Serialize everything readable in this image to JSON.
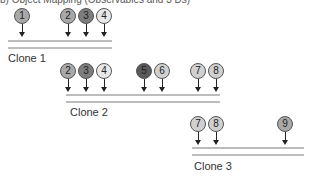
{
  "caption": "b) Object Mapping (Observables and 3 Ds)",
  "colors": {
    "medium": "#a8a8a8",
    "dark": "#7d7d7d",
    "darkest": "#5a5a5a",
    "light": "#d0d0d0",
    "lightest": "#e8e8e8",
    "line": "#bdbdbd"
  },
  "clones": [
    {
      "label": "Clone 1",
      "nodes": [
        {
          "id": "1",
          "x": 14,
          "y": 8,
          "fill": "#a8a8a8"
        },
        {
          "id": "2",
          "x": 60,
          "y": 8,
          "fill": "#a8a8a8"
        },
        {
          "id": "3",
          "x": 78,
          "y": 8,
          "fill": "#7d7d7d"
        },
        {
          "id": "4",
          "x": 96,
          "y": 8,
          "fill": "#e8e8e8"
        }
      ],
      "line1": {
        "x": 8,
        "y": 40,
        "w": 104
      },
      "line2": {
        "x": 8,
        "y": 47,
        "w": 104
      },
      "label_pos": {
        "x": 8,
        "y": 52
      }
    },
    {
      "label": "Clone 2",
      "nodes": [
        {
          "id": "2",
          "x": 60,
          "y": 63,
          "fill": "#a8a8a8"
        },
        {
          "id": "3",
          "x": 78,
          "y": 63,
          "fill": "#7d7d7d"
        },
        {
          "id": "4",
          "x": 96,
          "y": 63,
          "fill": "#e8e8e8"
        },
        {
          "id": "5",
          "x": 136,
          "y": 63,
          "fill": "#5a5a5a"
        },
        {
          "id": "6",
          "x": 154,
          "y": 63,
          "fill": "#d0d0d0"
        },
        {
          "id": "7",
          "x": 190,
          "y": 63,
          "fill": "#d0d0d0"
        },
        {
          "id": "8",
          "x": 208,
          "y": 63,
          "fill": "#d0d0d0"
        }
      ],
      "line1": {
        "x": 66,
        "y": 94,
        "w": 154
      },
      "line2": {
        "x": 66,
        "y": 101,
        "w": 154
      },
      "label_pos": {
        "x": 70,
        "y": 106
      }
    },
    {
      "label": "Clone 3",
      "nodes": [
        {
          "id": "7",
          "x": 190,
          "y": 116,
          "fill": "#d0d0d0"
        },
        {
          "id": "8",
          "x": 208,
          "y": 116,
          "fill": "#d0d0d0"
        },
        {
          "id": "9",
          "x": 277,
          "y": 116,
          "fill": "#a8a8a8"
        }
      ],
      "line1": {
        "x": 192,
        "y": 147,
        "w": 112
      },
      "line2": {
        "x": 192,
        "y": 154,
        "w": 112
      },
      "label_pos": {
        "x": 194,
        "y": 160
      }
    }
  ]
}
